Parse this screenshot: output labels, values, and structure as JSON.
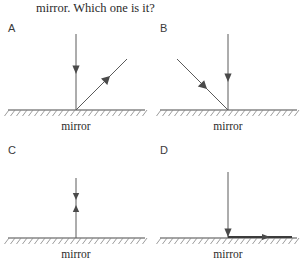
{
  "question": {
    "text": "mirror. Which one is it?"
  },
  "mirror_label": "mirror",
  "panels": [
    {
      "id": "A",
      "label": "A",
      "mirror_label": "mirror",
      "description": "Vertical ray travelling downward to the mirror and a reflected ray leaving up and to the right.",
      "rays": [
        {
          "name": "incident-ray",
          "direction": "down",
          "arrow": "toward-mirror"
        },
        {
          "name": "reflected-ray",
          "direction": "up-right",
          "arrow": "away-from-mirror"
        }
      ]
    },
    {
      "id": "B",
      "label": "B",
      "mirror_label": "mirror",
      "description": "Ray arriving from the upper left travelling down to the right, plus a vertical ray travelling downward.",
      "rays": [
        {
          "name": "incident-ray",
          "direction": "down-right",
          "arrow": "toward-mirror"
        },
        {
          "name": "second-ray",
          "direction": "down",
          "arrow": "toward-mirror"
        }
      ]
    },
    {
      "id": "C",
      "label": "C",
      "mirror_label": "mirror",
      "description": "A single vertical line above the mirror carrying a downward arrow and an upward arrow.",
      "rays": [
        {
          "name": "incident-ray",
          "direction": "down",
          "arrow": "toward-mirror"
        },
        {
          "name": "reflected-ray",
          "direction": "up",
          "arrow": "away-from-mirror"
        }
      ]
    },
    {
      "id": "D",
      "label": "D",
      "mirror_label": "mirror",
      "description": "Vertical ray travelling downward to the mirror and a ray running along the mirror surface to the right.",
      "rays": [
        {
          "name": "incident-ray",
          "direction": "down",
          "arrow": "toward-mirror"
        },
        {
          "name": "reflected-ray",
          "direction": "right-along-mirror",
          "arrow": "away-from-mirror"
        }
      ]
    }
  ],
  "colors": {
    "ray": "#5a5a5a",
    "mirror": "#4a4a4a",
    "hatch": "#8a8a8a",
    "text": "#2b2b2b",
    "background": "#ffffff"
  }
}
